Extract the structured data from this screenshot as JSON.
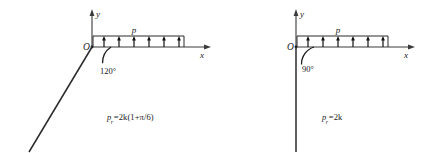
{
  "canvas": {
    "width": 434,
    "height": 153,
    "background": "#ffffff"
  },
  "figures": [
    {
      "id": "left",
      "axes": {
        "y_label": "y",
        "x_label": "x",
        "origin_label": "O"
      },
      "load": {
        "label": "p",
        "arrow_count": 6,
        "direction": "up"
      },
      "angle": {
        "value": "120°",
        "between": "negative-edge and positive-x-axis"
      },
      "edge": {
        "description": "straight boundary from origin into third quadrant"
      },
      "formula": {
        "lhs": "p",
        "lhs_sub": "r",
        "eq": "=",
        "rhs": "2k(1+π/6)",
        "full": "p r=2k(1+π/6)"
      }
    },
    {
      "id": "right",
      "axes": {
        "y_label": "y",
        "x_label": "x",
        "origin_label": "O"
      },
      "load": {
        "label": "p",
        "arrow_count": 6,
        "direction": "up"
      },
      "angle": {
        "value": "90°",
        "between": "negative-y-edge and positive-x-axis"
      },
      "edge": {
        "description": "straight vertical boundary from origin downward"
      },
      "formula": {
        "lhs": "p",
        "lhs_sub": "r",
        "eq": "=",
        "rhs": "2k",
        "full": "p r=2k"
      }
    }
  ],
  "colors": {
    "ink": "#1a1a1a",
    "axis": "#3a3a3a",
    "load": "#2b2b2b",
    "background": "#ffffff"
  }
}
